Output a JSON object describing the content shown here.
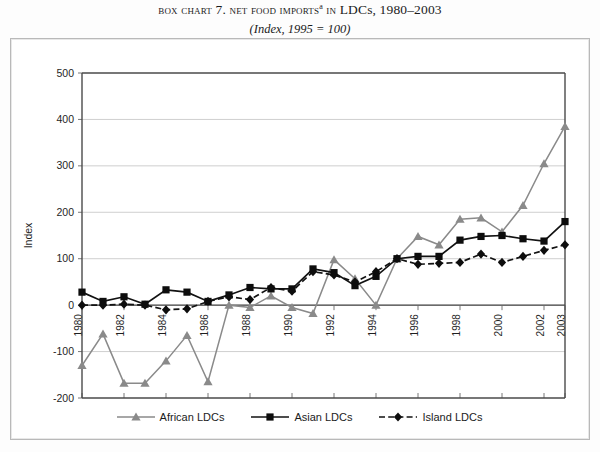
{
  "title": {
    "prefix_smallcaps": "Box chart",
    "number": "7.",
    "body_smallcaps": "Net food imports",
    "superscript": "a",
    "in_smallcaps": "in",
    "tail": "LDCs, 1980–2003",
    "subtitle": "(Index, 1995 = 100)"
  },
  "chart_data": {
    "type": "line",
    "subtitle": "(Index, 1995 = 100)",
    "xlabel": "",
    "ylabel": "Index",
    "ylim": [
      -200,
      500
    ],
    "ytick_labels": [
      "500",
      "400",
      "300",
      "200",
      "100",
      "0",
      "-100",
      "-200"
    ],
    "yticks": [
      500,
      400,
      300,
      200,
      100,
      0,
      -100,
      -200
    ],
    "grid": true,
    "legend_position": "bottom",
    "x": [
      1980,
      1981,
      1982,
      1983,
      1984,
      1985,
      1986,
      1987,
      1988,
      1989,
      1990,
      1991,
      1992,
      1993,
      1994,
      1995,
      1996,
      1997,
      1998,
      1999,
      2000,
      2001,
      2002,
      2003
    ],
    "xtick_labels": [
      "1980",
      "1982",
      "1984",
      "1986",
      "1988",
      "1990",
      "1992",
      "1994",
      "1996",
      "1998",
      "2000",
      "2002",
      "2003"
    ],
    "xticks": [
      1980,
      1982,
      1984,
      1986,
      1988,
      1990,
      1992,
      1994,
      1996,
      1998,
      2000,
      2002,
      2003
    ],
    "series": [
      {
        "name": "African LDCs",
        "marker": "triangle",
        "color": "#8a8a8a",
        "line_style": "solid",
        "values": [
          -130,
          -62,
          -168,
          -168,
          -120,
          -65,
          -165,
          0,
          -5,
          20,
          -5,
          -18,
          98,
          57,
          0,
          100,
          148,
          130,
          185,
          188,
          158,
          215,
          305,
          385
        ]
      },
      {
        "name": "Asian LDCs",
        "marker": "square",
        "color": "#0d0d0d",
        "line_style": "solid",
        "values": [
          28,
          8,
          18,
          2,
          33,
          28,
          8,
          22,
          38,
          35,
          35,
          78,
          70,
          42,
          62,
          100,
          105,
          105,
          140,
          148,
          150,
          143,
          138,
          180
        ]
      },
      {
        "name": "Island LDCs",
        "marker": "diamond",
        "color": "#0d0d0d",
        "line_style": "dashed",
        "values": [
          0,
          0,
          2,
          0,
          -10,
          -8,
          8,
          18,
          12,
          38,
          30,
          72,
          65,
          50,
          72,
          100,
          88,
          90,
          92,
          110,
          92,
          105,
          118,
          130
        ]
      }
    ]
  },
  "legend": {
    "items": [
      {
        "label": "African LDCs",
        "marker": "triangle-marker",
        "style": "solid"
      },
      {
        "label": "Asian LDCs",
        "marker": "square-marker",
        "style": "solid"
      },
      {
        "label": "Island LDCs",
        "marker": "diamond-marker",
        "style": "dashed"
      }
    ]
  }
}
